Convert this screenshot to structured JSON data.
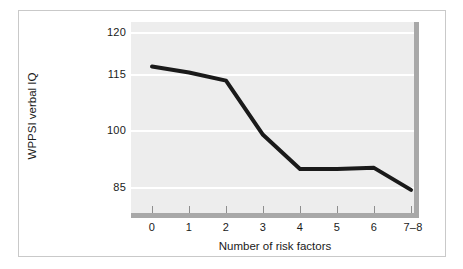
{
  "figure": {
    "background_color": "#ffffff",
    "frame_color": "#c9c9c9",
    "plot_background_color": "#ededed",
    "gridline_color": "#ffffff",
    "axis_color": "#a8a8a8",
    "line_color": "#1a1a1a"
  },
  "chart_data": {
    "type": "line",
    "title": "",
    "subtitle": "",
    "xlabel": "Number of risk factors",
    "ylabel": "WPPSI verbal IQ",
    "categories": [
      "0",
      "1",
      "2",
      "3",
      "4",
      "5",
      "6",
      "7–8"
    ],
    "values": [
      116.0,
      115.3,
      113.5,
      99.0,
      90.0,
      90.0,
      90.3,
      84.5
    ],
    "series": [
      {
        "name": "WPPSI verbal IQ",
        "values": [
          116.0,
          115.3,
          113.5,
          99.0,
          90.0,
          90.0,
          90.3,
          84.5
        ]
      }
    ],
    "ytick_labels": [
      "120",
      "115",
      "100",
      "85"
    ],
    "ytick_values": [
      120,
      115,
      100,
      85
    ],
    "ylim": [
      80.5,
      121.5
    ],
    "xlim": [
      -0.55,
      7.45
    ],
    "grid": true,
    "grid_axis": "y",
    "legend": false,
    "legend_position": "none",
    "annotations": [],
    "markers": false,
    "line_width_px": 4
  },
  "axes": {
    "x_tick_labels": [
      "0",
      "1",
      "2",
      "3",
      "4",
      "5",
      "6",
      "7–8"
    ],
    "y_tick_labels": [
      "120",
      "115",
      "100",
      "85"
    ],
    "x_title": "Number of risk factors",
    "y_title": "WPPSI verbal IQ"
  }
}
